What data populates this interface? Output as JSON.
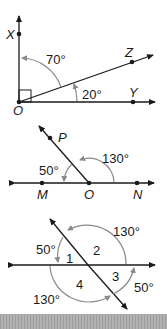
{
  "figure1": {
    "points": {
      "X": "X",
      "Z": "Z",
      "Y": "Y",
      "O": "O"
    },
    "angles": {
      "xoz": "70°",
      "zoy": "20°"
    },
    "right_angle": true
  },
  "figure2": {
    "points": {
      "P": "P",
      "M": "M",
      "O": "O",
      "N": "N"
    },
    "angles": {
      "mop": "50°",
      "pon": "130°"
    }
  },
  "figure3": {
    "angle_numbers": [
      "1",
      "2",
      "3",
      "4"
    ],
    "angles": {
      "top_right": "130°",
      "top_left": "50°",
      "bottom_right": "50°",
      "bottom_left": "130°"
    }
  },
  "colors": {
    "line": "#1a1a1a",
    "arc": "#8a8a8a",
    "footer_bar": "#a8a8a8"
  }
}
